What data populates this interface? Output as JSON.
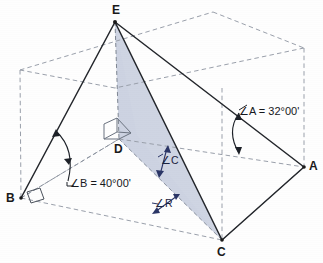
{
  "figure": {
    "type": "geometry-diagram",
    "vertices": [
      {
        "name": "vertex-label-E",
        "label": "E",
        "x": 112,
        "y": 4
      },
      {
        "name": "vertex-label-D",
        "label": "D",
        "x": 114,
        "y": 143
      },
      {
        "name": "vertex-label-B",
        "label": "B",
        "x": 6,
        "y": 192
      },
      {
        "name": "vertex-label-C",
        "label": "C",
        "x": 217,
        "y": 246
      },
      {
        "name": "vertex-label-A",
        "label": "A",
        "x": 309,
        "y": 160
      }
    ],
    "angles": [
      {
        "name": "angle-a-label",
        "label": "∠A = 32°00'",
        "x": 239,
        "y": 112
      },
      {
        "name": "angle-b-label",
        "label": "∠B = 40°00'",
        "x": 70,
        "y": 178
      },
      {
        "name": "angle-c-label",
        "label": "∠C",
        "x": 161,
        "y": 155
      },
      {
        "name": "angle-r-label",
        "label": "∠R",
        "x": 155,
        "y": 198
      }
    ],
    "colors": {
      "shaded_plane": "#ccd3e2",
      "solid_line": "#23262b",
      "dashed_line": "#9aa0ab",
      "accent_arrow": "#2a3566",
      "label_text": "#1a1a1a"
    },
    "geometry": {
      "box_top_back_left": [
        20,
        70
      ],
      "box_top_back_right": [
        213,
        12
      ],
      "box_top_front_right": [
        304,
        48
      ],
      "box_top_front_left": [
        115,
        88
      ],
      "box_bottom_back_left": [
        21,
        198
      ],
      "box_bottom_front_right": [
        304,
        167
      ],
      "box_bottom_front_left": [
        222,
        240
      ],
      "apex_E": [
        115,
        22
      ],
      "foot_D": [
        119,
        139
      ]
    }
  }
}
